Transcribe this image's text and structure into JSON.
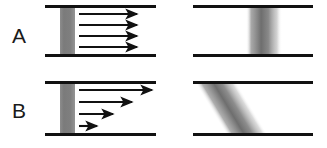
{
  "figure": {
    "width": 327,
    "height": 148,
    "background_color": "#ffffff"
  },
  "colors": {
    "wall_line": "#111111",
    "tracer_band": "#808080",
    "tracer_band_core": "#6e6e6e",
    "arrow": "#111111",
    "label_text": "#1a1a1a",
    "background": "#ffffff"
  },
  "rows": [
    {
      "id": "row-a",
      "label": "A",
      "label_x": 12,
      "label_y": 25,
      "flow_profile": "uniform-plug-flow",
      "left_panel": {
        "channel": {
          "x_start": 45,
          "x_end": 156,
          "top_wall_y": 6,
          "bottom_wall_y": 55,
          "wall_thickness": 3
        },
        "tracer_band": {
          "x": 60,
          "width": 15,
          "slant_top_offset": 0,
          "slant_bottom_offset": 0
        },
        "arrows": [
          {
            "y": 14,
            "x_start": 79,
            "x_end": 141,
            "length": 62
          },
          {
            "y": 25,
            "x_start": 79,
            "x_end": 141,
            "length": 62
          },
          {
            "y": 36,
            "x_start": 79,
            "x_end": 141,
            "length": 62
          },
          {
            "y": 47,
            "x_start": 79,
            "x_end": 141,
            "length": 62
          }
        ]
      },
      "right_panel": {
        "channel": {
          "x_start": 193,
          "x_end": 313,
          "top_wall_y": 6,
          "bottom_wall_y": 55,
          "wall_thickness": 3
        },
        "tracer_band": {
          "top_x": 251,
          "bottom_x": 251,
          "width": 26,
          "shear_offset": 0
        }
      }
    },
    {
      "id": "row-b",
      "label": "B",
      "label_x": 12,
      "label_y": 100,
      "flow_profile": "shear-flow-linear-gradient",
      "left_panel": {
        "channel": {
          "x_start": 45,
          "x_end": 156,
          "top_wall_y": 82,
          "bottom_wall_y": 134,
          "wall_thickness": 3
        },
        "tracer_band": {
          "x": 60,
          "width": 15,
          "slant_top_offset": 0,
          "slant_bottom_offset": 0
        },
        "arrows": [
          {
            "y": 90,
            "x_start": 79,
            "x_end": 156,
            "length": 77
          },
          {
            "y": 102,
            "x_start": 79,
            "x_end": 136,
            "length": 57
          },
          {
            "y": 114,
            "x_start": 79,
            "x_end": 117,
            "length": 38
          },
          {
            "y": 126,
            "x_start": 79,
            "x_end": 101,
            "length": 22
          }
        ]
      },
      "right_panel": {
        "channel": {
          "x_start": 193,
          "x_end": 313,
          "top_wall_y": 82,
          "bottom_wall_y": 134,
          "wall_thickness": 3
        },
        "tracer_band": {
          "top_x": 268,
          "bottom_x": 200,
          "width": 26,
          "shear_offset": 68
        }
      }
    }
  ]
}
